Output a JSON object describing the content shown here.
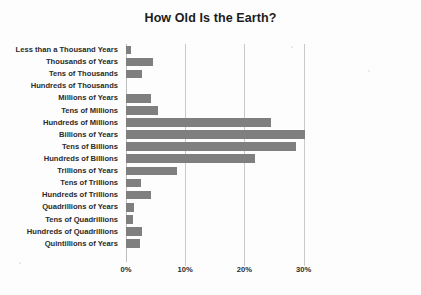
{
  "chart_data": {
    "type": "bar",
    "orientation": "horizontal",
    "title": "How Old Is the Earth?",
    "xlabel": "",
    "ylabel": "",
    "xlim": [
      0,
      30
    ],
    "xticks": [
      "0%",
      "10%",
      "20%",
      "30%"
    ],
    "xtick_values": [
      0,
      10,
      20,
      30
    ],
    "grid": true,
    "legend": false,
    "bar_color": "#7f7f7f",
    "categories": [
      "Less than a Thousand Years",
      "Thousands of Years",
      "Tens of Thousands",
      "Hundreds of Thousands",
      "Millions of Years",
      "Tens of Millions",
      "Hundreds of Millions",
      "Billions of Years",
      "Tens of Billions",
      "Hundreds of Billions",
      "Trillions of Years",
      "Tens of Trillions",
      "Hundreds of Trillions",
      "Quadrillions of Years",
      "Tens of Quadrillions",
      "Hundreds of Quadrillions",
      "Quintillions of Years"
    ],
    "values": [
      0.8,
      4.6,
      2.7,
      0.0,
      4.2,
      5.4,
      24.5,
      30.2,
      28.8,
      21.8,
      8.6,
      2.5,
      4.2,
      1.4,
      1.2,
      2.7,
      2.4
    ],
    "values_percent": [
      0.8,
      4.6,
      2.7,
      0.0,
      4.2,
      5.4,
      24.5,
      30.2,
      28.8,
      21.8,
      8.6,
      2.5,
      4.2,
      1.4,
      1.2,
      2.7,
      2.4
    ]
  }
}
